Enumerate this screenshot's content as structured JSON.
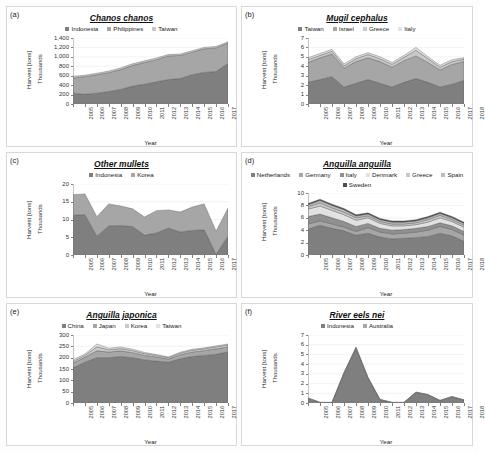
{
  "figure": {
    "axis_labels": {
      "x": "Year",
      "y": "Harvest [tons]",
      "scale": "Thousands"
    },
    "years": [
      2005,
      2006,
      2007,
      2008,
      2009,
      2010,
      2011,
      2012,
      2013,
      2014,
      2015,
      2016,
      2017,
      2018
    ],
    "palette": {
      "s1": "#7f7f7f",
      "s2": "#a6a6a6",
      "s3": "#c9c9c9",
      "s4": "#e2e2e2",
      "s5": "#909090",
      "s6": "#bdbdbd",
      "s7": "#4d4d4d",
      "axis": "#808080",
      "grid": "#e9e9e9",
      "outline": "#555555"
    }
  },
  "panels": [
    {
      "id": "(a)",
      "name": "panel-a",
      "chart_data": {
        "type": "area",
        "title": "Chanos chanos",
        "xlabel": "Year",
        "ylabel": "Harvest [tons]",
        "unit": "Thousands",
        "stacked": true,
        "x": [
          2005,
          2006,
          2007,
          2008,
          2009,
          2010,
          2011,
          2012,
          2013,
          2014,
          2015,
          2016,
          2017,
          2018
        ],
        "ylim": [
          0,
          1400
        ],
        "yticks": [
          0,
          200,
          400,
          600,
          800,
          1000,
          1200,
          1400
        ],
        "ytick_labels": [
          "0",
          "200",
          "400",
          "600",
          "800",
          "1,000",
          "1,200",
          "1,400"
        ],
        "grid": true,
        "legend": "top",
        "series": [
          {
            "name": "Indonesia",
            "color": "#7f7f7f",
            "values": [
              230,
              205,
              230,
              265,
              310,
              380,
              420,
              470,
              520,
              540,
              620,
              670,
              690,
              860
            ]
          },
          {
            "name": "Philippines",
            "color": "#a6a6a6",
            "values": [
              320,
              375,
              390,
              400,
              420,
              440,
              460,
              470,
              500,
              490,
              480,
              500,
              500,
              430
            ]
          },
          {
            "name": "Taiwan",
            "color": "#c9c9c9",
            "values": [
              35,
              30,
              32,
              33,
              35,
              35,
              35,
              35,
              30,
              30,
              30,
              30,
              30,
              28
            ]
          }
        ]
      }
    },
    {
      "id": "(b)",
      "name": "panel-b",
      "chart_data": {
        "type": "area",
        "title": "Mugil cephalus",
        "xlabel": "Year",
        "ylabel": "Harvest [tons]",
        "unit": "Thousands",
        "stacked": true,
        "x": [
          2005,
          2006,
          2007,
          2008,
          2009,
          2010,
          2011,
          2012,
          2013,
          2014,
          2015,
          2016,
          2017,
          2018
        ],
        "ylim": [
          0,
          7
        ],
        "yticks": [
          0,
          1,
          2,
          3,
          4,
          5,
          6,
          7
        ],
        "ytick_labels": [
          "0",
          "1",
          "2",
          "3",
          "4",
          "5",
          "6",
          "7"
        ],
        "grid": true,
        "legend": "top",
        "series": [
          {
            "name": "Taiwan",
            "color": "#7f7f7f",
            "values": [
              2.3,
              2.6,
              2.9,
              1.8,
              2.2,
              2.6,
              2.2,
              1.8,
              2.3,
              2.7,
              2.3,
              1.8,
              2.1,
              2.5
            ]
          },
          {
            "name": "Israel",
            "color": "#a6a6a6",
            "values": [
              2.1,
              2.3,
              2.4,
              2.0,
              2.3,
              2.3,
              2.3,
              2.1,
              2.3,
              2.4,
              2.1,
              1.8,
              2.1,
              2.0
            ]
          },
          {
            "name": "Greece",
            "color": "#c9c9c9",
            "values": [
              0.3,
              0.25,
              0.3,
              0.25,
              0.3,
              0.35,
              0.3,
              0.3,
              0.35,
              0.6,
              0.4,
              0.3,
              0.3,
              0.25
            ]
          },
          {
            "name": "Italy",
            "color": "#e2e2e2",
            "values": [
              0.2,
              0.2,
              0.2,
              0.2,
              0.2,
              0.2,
              0.2,
              0.2,
              0.2,
              0.3,
              0.2,
              0.2,
              0.2,
              0.15
            ]
          }
        ]
      }
    },
    {
      "id": "(c)",
      "name": "panel-c",
      "chart_data": {
        "type": "area",
        "title": "Other mullets",
        "xlabel": "Year",
        "ylabel": "Harvest [tons]",
        "unit": "Thousands",
        "stacked": true,
        "x": [
          2005,
          2006,
          2007,
          2008,
          2009,
          2010,
          2011,
          2012,
          2013,
          2014,
          2015,
          2016,
          2017,
          2018
        ],
        "ylim": [
          0,
          20
        ],
        "yticks": [
          0,
          5,
          10,
          15,
          20
        ],
        "ytick_labels": [
          "0",
          "5",
          "10",
          "15",
          "20"
        ],
        "grid": true,
        "legend": "top",
        "series": [
          {
            "name": "Indonesia",
            "color": "#7f7f7f",
            "values": [
              11.2,
              11.4,
              5.3,
              8.2,
              8.3,
              8.0,
              5.6,
              6.2,
              7.6,
              6.5,
              6.9,
              7.1,
              0.2,
              5.3
            ]
          },
          {
            "name": "Korea",
            "color": "#a6a6a6",
            "values": [
              5.8,
              5.8,
              5.5,
              6.2,
              5.5,
              5.0,
              5.1,
              6.3,
              5.1,
              5.6,
              6.6,
              7.3,
              6.5,
              7.9
            ]
          }
        ]
      }
    },
    {
      "id": "(d)",
      "name": "panel-d",
      "chart_data": {
        "type": "area",
        "title": "Anguilla anguilla",
        "xlabel": "Year",
        "ylabel": "Harvest [tons]",
        "unit": "Thousands",
        "stacked": true,
        "x": [
          2005,
          2006,
          2007,
          2008,
          2009,
          2010,
          2011,
          2012,
          2013,
          2014,
          2015,
          2016,
          2017,
          2018
        ],
        "ylim": [
          0,
          10
        ],
        "yticks": [
          0,
          2,
          4,
          6,
          8,
          10
        ],
        "ytick_labels": [
          "0",
          "2",
          "4",
          "6",
          "8",
          "10"
        ],
        "grid": true,
        "legend": "top",
        "series": [
          {
            "name": "Netherlands",
            "color": "#7f7f7f",
            "values": [
              4.2,
              4.8,
              4.3,
              3.9,
              3.2,
              3.5,
              2.9,
              2.6,
              2.7,
              2.8,
              3.0,
              3.5,
              3.1,
              2.2
            ]
          },
          {
            "name": "Germany",
            "color": "#a6a6a6",
            "values": [
              0.8,
              0.7,
              0.7,
              0.6,
              0.6,
              0.9,
              0.8,
              0.8,
              0.8,
              0.9,
              1.0,
              1.1,
              1.0,
              1.0
            ]
          },
          {
            "name": "Italy",
            "color": "#909090",
            "values": [
              1.2,
              1.1,
              1.0,
              0.9,
              0.8,
              0.7,
              0.6,
              0.6,
              0.6,
              0.6,
              0.6,
              0.6,
              0.6,
              0.6
            ]
          },
          {
            "name": "Denmark",
            "color": "#e2e2e2",
            "values": [
              1.2,
              1.3,
              1.2,
              1.1,
              1.0,
              0.9,
              0.8,
              0.7,
              0.6,
              0.6,
              0.7,
              0.8,
              0.7,
              0.7
            ]
          },
          {
            "name": "Greece",
            "color": "#c9c9c9",
            "values": [
              0.4,
              0.5,
              0.4,
              0.4,
              0.4,
              0.3,
              0.3,
              0.3,
              0.3,
              0.3,
              0.4,
              0.4,
              0.3,
              0.3
            ]
          },
          {
            "name": "Spain",
            "color": "#bdbdbd",
            "values": [
              0.3,
              0.4,
              0.4,
              0.4,
              0.3,
              0.3,
              0.3,
              0.3,
              0.3,
              0.3,
              0.3,
              0.3,
              0.3,
              0.3
            ]
          },
          {
            "name": "Sweden",
            "color": "#4d4d4d",
            "values": [
              0.2,
              0.2,
              0.2,
              0.2,
              0.2,
              0.2,
              0.2,
              0.2,
              0.2,
              0.2,
              0.2,
              0.2,
              0.2,
              0.2
            ]
          }
        ]
      }
    },
    {
      "id": "(e)",
      "name": "panel-e",
      "chart_data": {
        "type": "area",
        "title": "Anguilla japonica",
        "xlabel": "Year",
        "ylabel": "Harvest [tons]",
        "unit": "Thousands",
        "stacked": true,
        "x": [
          2005,
          2006,
          2007,
          2008,
          2009,
          2010,
          2011,
          2012,
          2013,
          2014,
          2015,
          2016,
          2017,
          2018
        ],
        "ylim": [
          0,
          300
        ],
        "yticks": [
          0,
          50,
          100,
          150,
          200,
          250,
          300
        ],
        "ytick_labels": [
          "0",
          "50",
          "100",
          "150",
          "200",
          "250",
          "300"
        ],
        "grid": true,
        "legend": "top",
        "series": [
          {
            "name": "China",
            "color": "#7f7f7f",
            "values": [
              155,
              180,
              200,
              200,
              205,
              200,
              190,
              185,
              180,
              195,
              205,
              210,
              215,
              225
            ]
          },
          {
            "name": "Japan",
            "color": "#a6a6a6",
            "values": [
              20,
              22,
              30,
              25,
              25,
              22,
              20,
              18,
              14,
              18,
              20,
              21,
              24,
              22
            ]
          },
          {
            "name": "Korea",
            "color": "#c9c9c9",
            "values": [
              8,
              8,
              18,
              10,
              10,
              9,
              8,
              7,
              6,
              7,
              8,
              8,
              9,
              9
            ]
          },
          {
            "name": "Taiwan",
            "color": "#e2e2e2",
            "values": [
              7,
              6,
              12,
              7,
              7,
              6,
              5,
              4,
              3,
              4,
              4,
              4,
              4,
              4
            ]
          }
        ]
      }
    },
    {
      "id": "(f)",
      "name": "panel-f",
      "chart_data": {
        "type": "area",
        "title": "River eels nei",
        "xlabel": "Year",
        "ylabel": "Harvest [tons]",
        "unit": "Thousands",
        "stacked": true,
        "x": [
          2005,
          2006,
          2007,
          2008,
          2009,
          2010,
          2011,
          2012,
          2013,
          2014,
          2015,
          2016,
          2017,
          2018
        ],
        "ylim": [
          0,
          7
        ],
        "yticks": [
          0,
          1,
          2,
          3,
          4,
          5,
          6,
          7
        ],
        "ytick_labels": [
          "0",
          "1",
          "2",
          "3",
          "4",
          "5",
          "6",
          "7"
        ],
        "grid": true,
        "legend": "top",
        "series": [
          {
            "name": "Indonesia",
            "color": "#7f7f7f",
            "values": [
              0.5,
              0.05,
              0.05,
              3.1,
              5.7,
              2.6,
              0.35,
              0.05,
              0.05,
              1.1,
              0.85,
              0.25,
              0.65,
              0.3
            ]
          },
          {
            "name": "Australia",
            "color": "#a6a6a6",
            "values": [
              0.03,
              0.03,
              0.03,
              0.03,
              0.03,
              0.03,
              0.03,
              0.03,
              0.03,
              0.03,
              0.03,
              0.03,
              0.03,
              0.03
            ]
          }
        ]
      }
    }
  ]
}
